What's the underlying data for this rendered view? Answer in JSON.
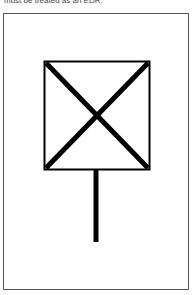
{
  "caption": "must be treated as an EDR.",
  "diagram": {
    "symbol": "square-with-x-on-post",
    "box": {
      "x": 44,
      "y": 61,
      "width": 106,
      "height": 109,
      "stroke": "#000000"
    },
    "post": {
      "x": 96,
      "y1": 170,
      "y2": 242
    },
    "frame_color": "#555555"
  }
}
